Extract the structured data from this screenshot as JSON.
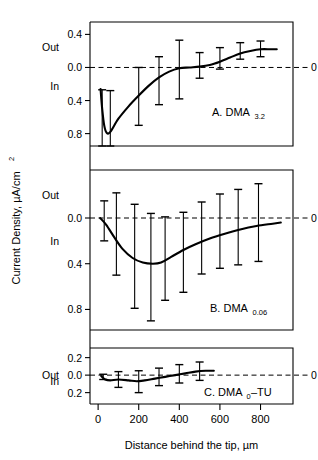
{
  "figure": {
    "y_axis_title": "Current Density, µA/cm",
    "y_axis_title_sup": "2",
    "x_axis_title": "Distance behind the tip, µm",
    "zero_right_label": "0",
    "out_label": "Out",
    "in_label": "In"
  },
  "chart_data": {
    "type": "line",
    "title": "",
    "xlabel": "Distance behind the tip, µm",
    "ylabel": "Current Density, µA/cm²",
    "xlim": [
      -40,
      960
    ],
    "xticks": [
      0,
      200,
      400,
      600,
      800
    ],
    "xticklabels": [
      "0",
      "200",
      "400",
      "600",
      "800"
    ],
    "grid": false,
    "legend": "none",
    "sign_convention": {
      "positive": "Out",
      "negative": "In"
    },
    "panels": [
      {
        "id": "A",
        "label": "A. DMA",
        "label_sub": "3.2",
        "ylim": [
          -0.95,
          0.55
        ],
        "yticks": [
          0.4,
          0.0,
          -0.4,
          -0.8
        ],
        "yticklabels": [
          "0.4",
          "0.0",
          "0.4",
          "0.8"
        ],
        "out_at": 0.25,
        "in_at": -0.22,
        "zero_line": 0.0,
        "curve": [
          {
            "x": 12,
            "y": -0.26
          },
          {
            "x": 20,
            "y": -0.5
          },
          {
            "x": 30,
            "y": -0.7
          },
          {
            "x": 42,
            "y": -0.79
          },
          {
            "x": 60,
            "y": -0.78
          },
          {
            "x": 100,
            "y": -0.62
          },
          {
            "x": 150,
            "y": -0.47
          },
          {
            "x": 200,
            "y": -0.34
          },
          {
            "x": 250,
            "y": -0.22
          },
          {
            "x": 300,
            "y": -0.12
          },
          {
            "x": 350,
            "y": -0.05
          },
          {
            "x": 400,
            "y": -0.01
          },
          {
            "x": 450,
            "y": 0.0
          },
          {
            "x": 500,
            "y": 0.01
          },
          {
            "x": 550,
            "y": 0.03
          },
          {
            "x": 600,
            "y": 0.07
          },
          {
            "x": 650,
            "y": 0.12
          },
          {
            "x": 700,
            "y": 0.17
          },
          {
            "x": 750,
            "y": 0.2
          },
          {
            "x": 800,
            "y": 0.22
          },
          {
            "x": 850,
            "y": 0.22
          },
          {
            "x": 880,
            "y": 0.22
          }
        ],
        "points": [
          {
            "x": 20,
            "y": -0.57,
            "err_lo": 0.83,
            "err_hi": 0.3
          },
          {
            "x": 60,
            "y": -0.78,
            "err_lo": 0.17,
            "err_hi": 0.5
          },
          {
            "x": 200,
            "y": -0.34,
            "err_lo": 0.36,
            "err_hi": 0.34
          },
          {
            "x": 300,
            "y": -0.12,
            "err_lo": 0.33,
            "err_hi": 0.25
          },
          {
            "x": 400,
            "y": -0.01,
            "err_lo": 0.37,
            "err_hi": 0.34
          },
          {
            "x": 500,
            "y": 0.01,
            "err_lo": 0.14,
            "err_hi": 0.17
          },
          {
            "x": 600,
            "y": 0.07,
            "err_lo": 0.09,
            "err_hi": 0.17
          },
          {
            "x": 700,
            "y": 0.17,
            "err_lo": 0.07,
            "err_hi": 0.13
          },
          {
            "x": 800,
            "y": 0.22,
            "err_lo": 0.09,
            "err_hi": 0.1
          }
        ]
      },
      {
        "id": "B",
        "label": "B. DMA",
        "label_sub": "0.06",
        "ylim": [
          -0.98,
          0.42
        ],
        "yticks": [
          0.0,
          -0.4,
          -0.8
        ],
        "yticklabels": [
          "0.0",
          "0.4",
          "0.8"
        ],
        "out_at": 0.2,
        "in_at": -0.2,
        "zero_line": 0.0,
        "curve": [
          {
            "x": 10,
            "y": 0.0
          },
          {
            "x": 40,
            "y": -0.06
          },
          {
            "x": 80,
            "y": -0.17
          },
          {
            "x": 120,
            "y": -0.27
          },
          {
            "x": 170,
            "y": -0.35
          },
          {
            "x": 220,
            "y": -0.39
          },
          {
            "x": 270,
            "y": -0.4
          },
          {
            "x": 310,
            "y": -0.39
          },
          {
            "x": 360,
            "y": -0.34
          },
          {
            "x": 420,
            "y": -0.28
          },
          {
            "x": 480,
            "y": -0.23
          },
          {
            "x": 550,
            "y": -0.18
          },
          {
            "x": 620,
            "y": -0.14
          },
          {
            "x": 700,
            "y": -0.1
          },
          {
            "x": 780,
            "y": -0.07
          },
          {
            "x": 860,
            "y": -0.05
          },
          {
            "x": 900,
            "y": -0.04
          }
        ],
        "points": [
          {
            "x": 30,
            "y": -0.03,
            "err_lo": 0.17,
            "err_hi": 0.18
          },
          {
            "x": 90,
            "y": -0.2,
            "err_lo": 0.3,
            "err_hi": 0.42
          },
          {
            "x": 180,
            "y": -0.36,
            "err_lo": 0.43,
            "err_hi": 0.48
          },
          {
            "x": 260,
            "y": -0.4,
            "err_lo": 0.5,
            "err_hi": 0.44
          },
          {
            "x": 330,
            "y": -0.37,
            "err_lo": 0.35,
            "err_hi": 0.38
          },
          {
            "x": 420,
            "y": -0.28,
            "err_lo": 0.37,
            "err_hi": 0.33
          },
          {
            "x": 510,
            "y": -0.21,
            "err_lo": 0.28,
            "err_hi": 0.35
          },
          {
            "x": 600,
            "y": -0.16,
            "err_lo": 0.28,
            "err_hi": 0.37
          },
          {
            "x": 690,
            "y": -0.11,
            "err_lo": 0.3,
            "err_hi": 0.36
          },
          {
            "x": 790,
            "y": -0.07,
            "err_lo": 0.31,
            "err_hi": 0.37
          }
        ]
      },
      {
        "id": "C",
        "label": "C. DMA",
        "label_sub": "0",
        "label_tail": "–TU",
        "ylim": [
          -0.33,
          0.31
        ],
        "yticks": [
          0.2,
          0.0,
          -0.2
        ],
        "yticklabels": [
          "0.2",
          "0.0",
          "0.2"
        ],
        "out_at": 0.0,
        "in_at": -0.07,
        "zero_line": 0.0,
        "curve": [
          {
            "x": 15,
            "y": -0.01
          },
          {
            "x": 35,
            "y": -0.05
          },
          {
            "x": 60,
            "y": -0.06
          },
          {
            "x": 100,
            "y": -0.05
          },
          {
            "x": 150,
            "y": -0.06
          },
          {
            "x": 190,
            "y": -0.07
          },
          {
            "x": 230,
            "y": -0.06
          },
          {
            "x": 280,
            "y": -0.04
          },
          {
            "x": 330,
            "y": -0.02
          },
          {
            "x": 380,
            "y": 0.0
          },
          {
            "x": 430,
            "y": 0.02
          },
          {
            "x": 480,
            "y": 0.04
          },
          {
            "x": 530,
            "y": 0.05
          },
          {
            "x": 570,
            "y": 0.05
          }
        ],
        "points": [
          {
            "x": 25,
            "y": -0.02,
            "err_lo": 0.03,
            "err_hi": 0.03
          },
          {
            "x": 100,
            "y": -0.05,
            "err_lo": 0.09,
            "err_hi": 0.09
          },
          {
            "x": 200,
            "y": -0.07,
            "err_lo": 0.13,
            "err_hi": 0.12
          },
          {
            "x": 300,
            "y": -0.03,
            "err_lo": 0.09,
            "err_hi": 0.11
          },
          {
            "x": 400,
            "y": 0.01,
            "err_lo": 0.1,
            "err_hi": 0.11
          },
          {
            "x": 500,
            "y": 0.05,
            "err_lo": 0.11,
            "err_hi": 0.1
          }
        ]
      }
    ]
  }
}
